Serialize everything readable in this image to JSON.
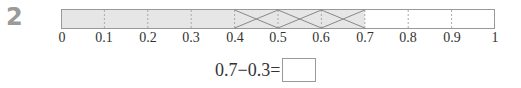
{
  "problem": {
    "number": "2",
    "bar": {
      "min": 0,
      "max": 1,
      "divisions": 10,
      "shaded_to": 0.7,
      "crossed_from": 0.4,
      "crossed_to": 0.7,
      "shade_color": "#e6e6e6",
      "border_color": "#999999",
      "cross_color": "#888888"
    },
    "tick_labels": [
      "0",
      "0.1",
      "0.2",
      "0.3",
      "0.4",
      "0.5",
      "0.6",
      "0.7",
      "0.8",
      "0.9",
      "1"
    ],
    "equation": {
      "expression": "0.7−0.3=",
      "answer": ""
    }
  }
}
